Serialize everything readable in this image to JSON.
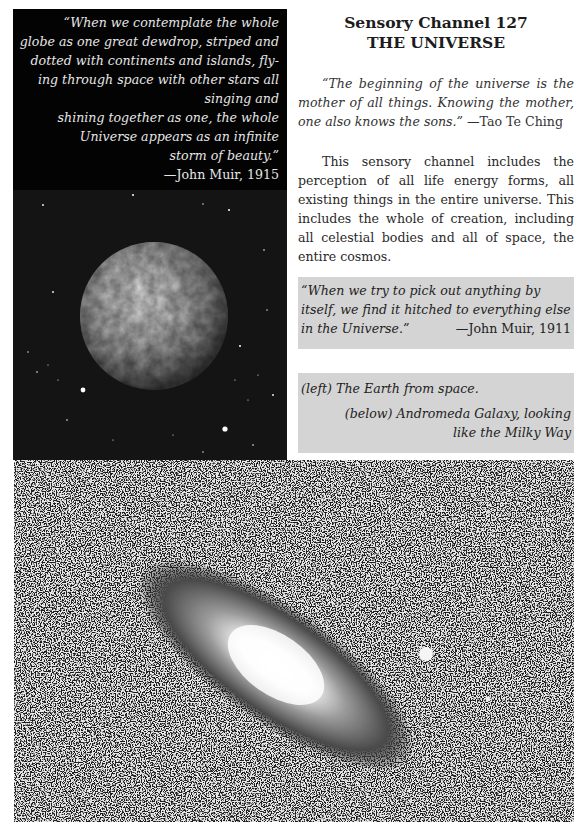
{
  "left_panel": {
    "quote_lines": [
      "“When we contemplate the whole",
      "globe as one great dewdrop, striped and",
      "dotted with continents and islands, fly-",
      "ing through space with other stars all",
      "singing and",
      "shining together as one, the whole",
      "Universe appears as an infinite",
      "storm of beauty.”"
    ],
    "quote_attribution": "—John Muir, 1915",
    "image": "earth-from-space-photo"
  },
  "right_column": {
    "title_line1": "Sensory Channel 127",
    "title_line2": "THE UNIVERSE",
    "epigraph_quote": "“The beginning of the universe is the mother of all things. Knowing the mother, one also knows the sons.”",
    "epigraph_attribution": "—Tao Te Ching",
    "paragraph": "This sensory channel includes the perception of all life energy forms, all existing things in the entire universe. This includes the whole of creation, including all celestial bodies and all of space, the entire cosmos.",
    "muir_quote": "“When we try to pick out anything by itself, we find it hitched to everything else in the Universe.”",
    "muir_attribution": "—John Muir, 1911",
    "caption_left": "(left) The Earth from space.",
    "caption_below": "(below) Andromeda Galaxy, looking like the Milky Way"
  },
  "galaxy_panel": {
    "image": "andromeda-galaxy-photo"
  },
  "colors": {
    "panel_black": "#060606",
    "caption_grey": "#d4d4d4",
    "text_light": "#e6e6e6"
  }
}
